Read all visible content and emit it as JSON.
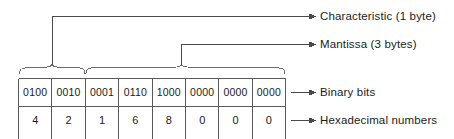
{
  "figure": {
    "line_color": "#4a4a4a",
    "text_color": "#1b1b1b",
    "background": "#ffffff"
  },
  "table": {
    "columns": 8,
    "rows": [
      {
        "name": "binary-bits",
        "label": "Binary bits",
        "cells": [
          "0100",
          "0010",
          "0001",
          "0110",
          "1000",
          "0000",
          "0000",
          "0000"
        ]
      },
      {
        "name": "hexadecimal-numbers",
        "label": "Hexadecimal numbers",
        "cells": [
          "4",
          "2",
          "1",
          "6",
          "8",
          "0",
          "0",
          "0"
        ]
      }
    ]
  },
  "callouts": [
    {
      "id": "characteristic",
      "label": "Characteristic (1 byte)",
      "spans_cells": "1-2",
      "bytes": 1
    },
    {
      "id": "mantissa",
      "label": "Mantissa (3 bytes)",
      "spans_cells": "3-8",
      "bytes": 3
    }
  ],
  "row_labels": [
    {
      "id": "binary-bits",
      "label": "Binary bits"
    },
    {
      "id": "hexadecimal-numbers",
      "label": "Hexadecimal numbers"
    }
  ]
}
